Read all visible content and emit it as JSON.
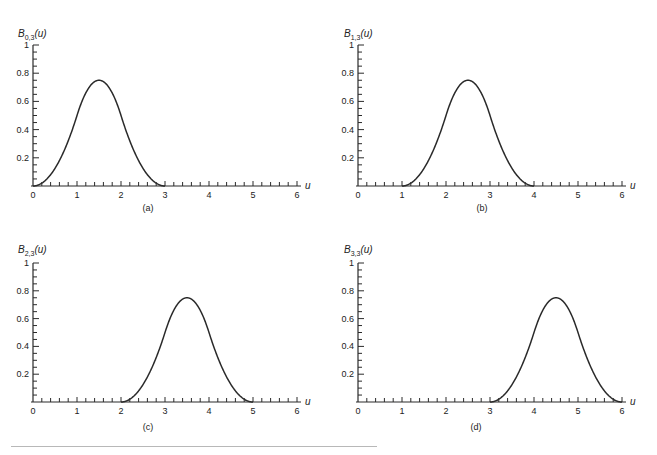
{
  "figure": {
    "background": "#ffffff",
    "line_color": "#2a2a2a",
    "rule_color": "#b8b8b8"
  },
  "chart_data": [
    {
      "type": "line",
      "panel_label": "(a)",
      "title": "B",
      "title_subscript": "0,3",
      "title_suffix": "(u)",
      "xlabel": "u",
      "ylabel": "B0,3(u)",
      "xlim": [
        0,
        6
      ],
      "ylim": [
        0,
        1
      ],
      "xticks": [
        "0",
        "1",
        "2",
        "3",
        "4",
        "5",
        "6"
      ],
      "yticks": [
        "0.2",
        "0.4",
        "0.6",
        "0.8",
        "1"
      ],
      "grid": false,
      "support": [
        0,
        3
      ],
      "peak": {
        "u": 1.5,
        "value": 0.75
      },
      "x": [
        0,
        0.5,
        1,
        1.5,
        2,
        2.5,
        3,
        4,
        5,
        6
      ],
      "values": [
        0,
        0.125,
        0.5,
        0.75,
        0.5,
        0.125,
        0,
        0,
        0,
        0
      ]
    },
    {
      "type": "line",
      "panel_label": "(b)",
      "title": "B",
      "title_subscript": "1,3",
      "title_suffix": "(u)",
      "xlabel": "u",
      "ylabel": "B1,3(u)",
      "xlim": [
        0,
        6
      ],
      "ylim": [
        0,
        1
      ],
      "xticks": [
        "0",
        "1",
        "2",
        "3",
        "4",
        "5",
        "6"
      ],
      "yticks": [
        "0.2",
        "0.4",
        "0.6",
        "0.8",
        "1"
      ],
      "grid": false,
      "support": [
        1,
        4
      ],
      "peak": {
        "u": 2.5,
        "value": 0.75
      },
      "x": [
        0,
        1,
        1.5,
        2,
        2.5,
        3,
        3.5,
        4,
        5,
        6
      ],
      "values": [
        0,
        0,
        0.125,
        0.5,
        0.75,
        0.5,
        0.125,
        0,
        0,
        0
      ]
    },
    {
      "type": "line",
      "panel_label": "(c)",
      "title": "B",
      "title_subscript": "2,3",
      "title_suffix": "(u)",
      "xlabel": "u",
      "ylabel": "B2,3(u)",
      "xlim": [
        0,
        6
      ],
      "ylim": [
        0,
        1
      ],
      "xticks": [
        "0",
        "1",
        "2",
        "3",
        "4",
        "5",
        "6"
      ],
      "yticks": [
        "0.2",
        "0.4",
        "0.6",
        "0.8",
        "1"
      ],
      "grid": false,
      "support": [
        2,
        5
      ],
      "peak": {
        "u": 3.5,
        "value": 0.75
      },
      "x": [
        0,
        1,
        2,
        2.5,
        3,
        3.5,
        4,
        4.5,
        5,
        6
      ],
      "values": [
        0,
        0,
        0,
        0.125,
        0.5,
        0.75,
        0.5,
        0.125,
        0,
        0
      ]
    },
    {
      "type": "line",
      "panel_label": "(d)",
      "title": "B",
      "title_subscript": "3,3",
      "title_suffix": "(u)",
      "xlabel": "u",
      "ylabel": "B3,3(u)",
      "xlim": [
        0,
        6
      ],
      "ylim": [
        0,
        1
      ],
      "xticks": [
        "0",
        "1",
        "2",
        "3",
        "4",
        "5",
        "6"
      ],
      "yticks": [
        "0.2",
        "0.4",
        "0.6",
        "0.8",
        "1"
      ],
      "grid": false,
      "support": [
        3,
        6
      ],
      "peak": {
        "u": 4.5,
        "value": 0.75
      },
      "x": [
        0,
        1,
        2,
        3,
        3.5,
        4,
        4.5,
        5,
        5.5,
        6
      ],
      "values": [
        0,
        0,
        0,
        0,
        0.125,
        0.5,
        0.75,
        0.5,
        0.125,
        0
      ]
    }
  ],
  "layout": {
    "panels": [
      {
        "ox": 33,
        "oy": 186,
        "xscale": 44,
        "yscale": 141,
        "title_x": 18,
        "title_y": 37,
        "label_x": 148,
        "label_y": 211
      },
      {
        "ox": 358,
        "oy": 186,
        "xscale": 44,
        "yscale": 141,
        "title_x": 344,
        "title_y": 37,
        "label_x": 482,
        "label_y": 211
      },
      {
        "ox": 33,
        "oy": 402,
        "xscale": 44,
        "yscale": 139,
        "title_x": 18,
        "title_y": 253,
        "label_x": 148,
        "label_y": 430
      },
      {
        "ox": 358,
        "oy": 402,
        "xscale": 44,
        "yscale": 139,
        "title_x": 344,
        "title_y": 253,
        "label_x": 476,
        "label_y": 430
      }
    ]
  }
}
